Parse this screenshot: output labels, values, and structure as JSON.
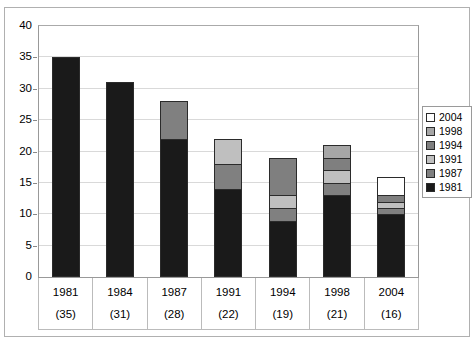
{
  "chart_data": {
    "type": "bar",
    "subtype": "stacked-bar",
    "title": "",
    "xlabel": "",
    "ylabel": "",
    "ylim": [
      0,
      40
    ],
    "ytick_step": 5,
    "yticks": [
      0,
      5,
      10,
      15,
      20,
      25,
      30,
      35,
      40
    ],
    "ytick_labels": [
      "0",
      "5",
      "10",
      "15",
      "20",
      "25",
      "30",
      "35",
      "40"
    ],
    "grid": true,
    "grid_axis": "y",
    "legend_position": "right",
    "categories": [
      "1981",
      "1984",
      "1987",
      "1991",
      "1994",
      "1998",
      "2004"
    ],
    "category_sublabels": [
      "(35)",
      "(31)",
      "(28)",
      "(22)",
      "(19)",
      "(21)",
      "(16)"
    ],
    "totals": [
      35,
      31,
      28,
      22,
      19,
      21,
      16
    ],
    "series": [
      {
        "name": "1981",
        "color": "#1a1a1a",
        "values": [
          35,
          31,
          22,
          14,
          9,
          13,
          10
        ]
      },
      {
        "name": "1987",
        "color": "#808080",
        "values": [
          0,
          0,
          6,
          4,
          2,
          2,
          1
        ]
      },
      {
        "name": "1991",
        "color": "#bfbfbf",
        "values": [
          0,
          0,
          0,
          4,
          2,
          2,
          1
        ]
      },
      {
        "name": "1994",
        "color": "#7f7f7f",
        "values": [
          0,
          0,
          0,
          0,
          6,
          2,
          1
        ]
      },
      {
        "name": "1998",
        "color": "#a6a6a6",
        "values": [
          0,
          0,
          0,
          0,
          0,
          2,
          0
        ]
      },
      {
        "name": "2004",
        "color": "#ffffff",
        "values": [
          0,
          0,
          0,
          0,
          0,
          0,
          3
        ]
      }
    ],
    "legend": [
      {
        "label": "2004",
        "color": "#ffffff"
      },
      {
        "label": "1998",
        "color": "#a6a6a6"
      },
      {
        "label": "1994",
        "color": "#7f7f7f"
      },
      {
        "label": "1991",
        "color": "#bfbfbf"
      },
      {
        "label": "1987",
        "color": "#808080"
      },
      {
        "label": "1981",
        "color": "#1a1a1a"
      }
    ]
  },
  "cropped_title": ""
}
